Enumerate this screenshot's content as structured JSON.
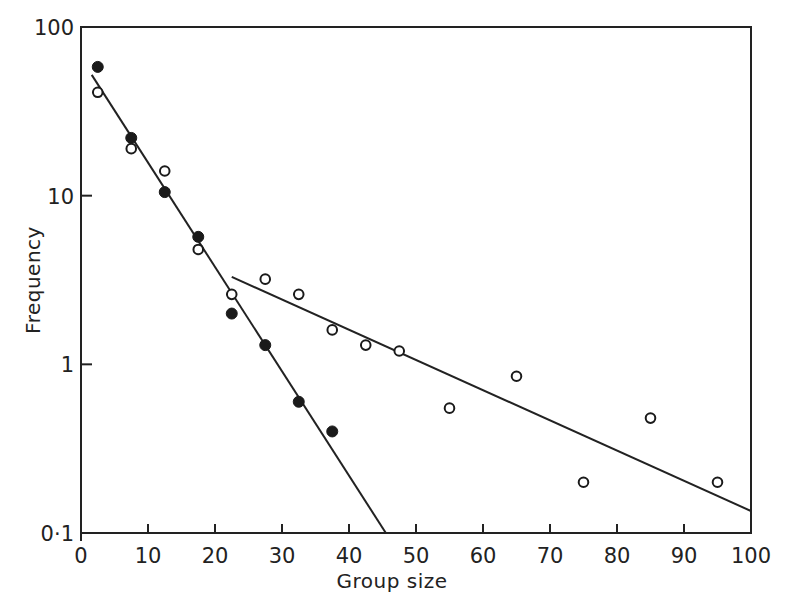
{
  "chart_data": {
    "type": "scatter",
    "title": "",
    "xlabel": "Group size",
    "ylabel": "Frequency",
    "xlim": [
      0,
      100
    ],
    "ylim": [
      0.1,
      100
    ],
    "yscale": "log",
    "grid": false,
    "legend": null,
    "x_ticks": [
      0,
      10,
      20,
      30,
      40,
      50,
      60,
      70,
      80,
      90,
      100
    ],
    "x_tick_labels": [
      "0",
      "10",
      "20",
      "30",
      "40",
      "50",
      "60",
      "70",
      "80",
      "90",
      "100"
    ],
    "y_ticks": [
      0.1,
      1,
      10,
      100
    ],
    "y_tick_labels": [
      "0·1",
      "1",
      "10",
      "100"
    ],
    "series": [
      {
        "name": "filled circles",
        "marker": "filled-circle",
        "points": [
          {
            "x": 2.5,
            "y": 58
          },
          {
            "x": 7.5,
            "y": 22
          },
          {
            "x": 12.5,
            "y": 10.5
          },
          {
            "x": 17.5,
            "y": 5.7
          },
          {
            "x": 22.5,
            "y": 2.0
          },
          {
            "x": 27.5,
            "y": 1.3
          },
          {
            "x": 32.5,
            "y": 0.6
          },
          {
            "x": 37.5,
            "y": 0.4
          }
        ]
      },
      {
        "name": "open circles",
        "marker": "open-circle",
        "points": [
          {
            "x": 2.5,
            "y": 41
          },
          {
            "x": 7.5,
            "y": 19
          },
          {
            "x": 12.5,
            "y": 14
          },
          {
            "x": 17.5,
            "y": 4.8
          },
          {
            "x": 22.5,
            "y": 2.6
          },
          {
            "x": 27.5,
            "y": 3.2
          },
          {
            "x": 32.5,
            "y": 2.6
          },
          {
            "x": 37.5,
            "y": 1.6
          },
          {
            "x": 42.5,
            "y": 1.3
          },
          {
            "x": 47.5,
            "y": 1.2
          },
          {
            "x": 55,
            "y": 0.55
          },
          {
            "x": 65,
            "y": 0.85
          },
          {
            "x": 75,
            "y": 0.2
          },
          {
            "x": 85,
            "y": 0.48
          },
          {
            "x": 95,
            "y": 0.2
          }
        ]
      }
    ],
    "fit_lines": [
      {
        "name": "steep fit",
        "from": {
          "x": 1.6,
          "y": 52
        },
        "to": {
          "x": 45.5,
          "y": 0.1
        }
      },
      {
        "name": "shallow fit",
        "from": {
          "x": 22.5,
          "y": 3.3
        },
        "to": {
          "x": 100,
          "y": 0.135
        }
      }
    ]
  }
}
